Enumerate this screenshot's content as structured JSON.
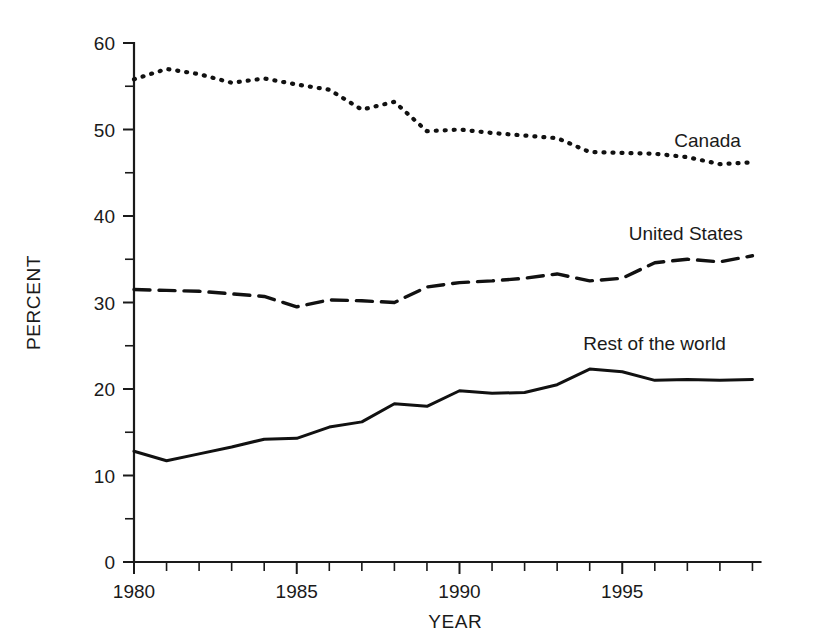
{
  "figure": {
    "faint_top_text": "",
    "background_color": "#ffffff",
    "ink_color": "#111111"
  },
  "axes": {
    "y_title": "PERCENT",
    "x_title": "YEAR",
    "y_tick_labels": [
      "0",
      "10",
      "20",
      "30",
      "40",
      "50",
      "60"
    ],
    "x_tick_labels": [
      "1980",
      "1985",
      "1990",
      "1995"
    ]
  },
  "labels": {
    "canada": "Canada",
    "united_states": "United States",
    "rest_of_world": "Rest of the world"
  },
  "chart_data": {
    "type": "line",
    "title": "",
    "subtitle": "",
    "xlabel": "YEAR",
    "ylabel": "PERCENT",
    "xlim": [
      1979.6,
      1999.0
    ],
    "ylim": [
      0,
      60
    ],
    "grid": false,
    "legend_position": "inline-right-of-series",
    "x": [
      1980,
      1981,
      1982,
      1983,
      1984,
      1985,
      1986,
      1987,
      1988,
      1989,
      1990,
      1991,
      1992,
      1993,
      1994,
      1995,
      1996,
      1997,
      1998,
      1999
    ],
    "x_tick_values": [
      1980,
      1985,
      1990,
      1995
    ],
    "y_tick_values": [
      0,
      10,
      20,
      30,
      40,
      50,
      60
    ],
    "y_minor_tick_values": [
      5,
      15,
      25,
      35,
      45,
      55
    ],
    "series": [
      {
        "name": "Canada",
        "style": "dotted",
        "label_x": 1996.6,
        "label_y": 48.0,
        "values": [
          55.8,
          57.0,
          56.4,
          55.4,
          55.9,
          55.2,
          54.6,
          52.3,
          53.2,
          49.8,
          50.0,
          49.6,
          49.3,
          49.0,
          47.4,
          47.3,
          47.2,
          46.8,
          46.0,
          46.2
        ]
      },
      {
        "name": "United States",
        "style": "dashed",
        "label_x": 1995.2,
        "label_y": 37.2,
        "values": [
          31.5,
          31.4,
          31.3,
          31.0,
          30.7,
          29.5,
          30.3,
          30.2,
          30.0,
          31.8,
          32.3,
          32.5,
          32.8,
          33.3,
          32.5,
          32.8,
          34.6,
          35.0,
          34.7,
          35.4
        ]
      },
      {
        "name": "Rest of the world",
        "style": "solid",
        "label_x": 1993.8,
        "label_y": 24.5,
        "values": [
          12.8,
          11.7,
          12.5,
          13.3,
          14.2,
          14.3,
          15.6,
          16.2,
          18.3,
          18.0,
          19.8,
          19.5,
          19.6,
          20.5,
          22.3,
          22.0,
          21.0,
          21.1,
          21.0,
          21.1
        ]
      }
    ]
  }
}
